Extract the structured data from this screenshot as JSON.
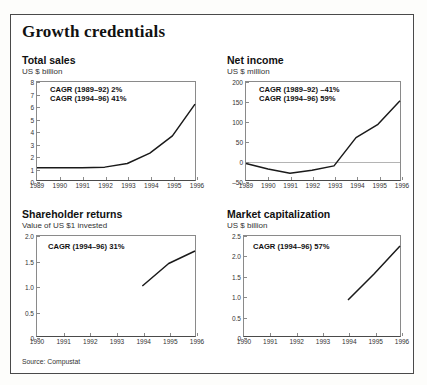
{
  "title": "Growth credentials",
  "source": "Source: Compustat",
  "panels": [
    {
      "name": "total-sales",
      "heading": "Total sales",
      "subtitle": "US $ billion",
      "annotations": [
        "CAGR (1989–92) 2%",
        "CAGR (1994–96) 41%"
      ],
      "chart_data": {
        "type": "line",
        "title": "Total sales",
        "xlabel": "",
        "ylabel": "US $ billion",
        "ylim": [
          0,
          8
        ],
        "yticks": [
          "0",
          "1",
          "2",
          "3",
          "4",
          "5",
          "6",
          "7",
          "8"
        ],
        "xlim": [
          1989,
          1996
        ],
        "categories": [
          "1989",
          "1990",
          "1991",
          "1992",
          "1993",
          "1994",
          "1995",
          "1996"
        ],
        "values": [
          1.0,
          1.0,
          1.0,
          1.05,
          1.35,
          2.2,
          3.6,
          6.2
        ],
        "grid": false,
        "legend": "none"
      }
    },
    {
      "name": "net-income",
      "heading": "Net income",
      "subtitle": "US $ million",
      "annotations": [
        "CAGR (1989–92) –41%",
        "CAGR (1994–96) 59%"
      ],
      "chart_data": {
        "type": "line",
        "title": "Net income",
        "xlabel": "",
        "ylabel": "US $ million",
        "ylim": [
          -50,
          200
        ],
        "yticks": [
          "-50",
          "0",
          "50",
          "100",
          "150",
          "200"
        ],
        "xlim": [
          1989,
          1996
        ],
        "categories": [
          "1989",
          "1990",
          "1991",
          "1992",
          "1993",
          "1994",
          "1995",
          "1996"
        ],
        "values": [
          -8,
          -22,
          -33,
          -25,
          -14,
          58,
          92,
          152
        ],
        "grid": false,
        "legend": "none"
      }
    },
    {
      "name": "shareholder-returns",
      "heading": "Shareholder returns",
      "subtitle": "Value of US $1 invested",
      "annotations": [
        "CAGR (1994–96) 31%"
      ],
      "chart_data": {
        "type": "line",
        "title": "Shareholder returns",
        "xlabel": "",
        "ylabel": "Value of US $1 invested",
        "ylim": [
          0,
          2.0
        ],
        "yticks": [
          "0",
          "0.5",
          "1.0",
          "1.5",
          "2.0"
        ],
        "xlim": [
          1990,
          1996
        ],
        "categories": [
          "1990",
          "1991",
          "1992",
          "1993",
          "1994",
          "1995",
          "1996"
        ],
        "values": [
          null,
          null,
          null,
          null,
          1.0,
          1.45,
          1.7
        ],
        "grid": false,
        "legend": "none"
      }
    },
    {
      "name": "market-capitalization",
      "heading": "Market capitalization",
      "subtitle": "US $ billion",
      "annotations": [
        "CAGR (1994–96) 57%"
      ],
      "chart_data": {
        "type": "line",
        "title": "Market capitalization",
        "xlabel": "",
        "ylabel": "US $ billion",
        "ylim": [
          0,
          2.5
        ],
        "yticks": [
          "0",
          "0.5",
          "1.0",
          "1.5",
          "2.0",
          "2.5"
        ],
        "xlim": [
          1990,
          1996
        ],
        "categories": [
          "1990",
          "1991",
          "1992",
          "1993",
          "1994",
          "1995",
          "1996"
        ],
        "values": [
          null,
          null,
          null,
          null,
          0.9,
          1.55,
          2.25
        ],
        "grid": false,
        "legend": "none"
      }
    }
  ]
}
